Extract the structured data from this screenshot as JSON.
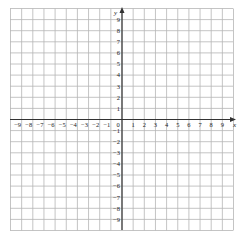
{
  "chart_data": {
    "type": "scatter",
    "title": "",
    "xlabel": "x",
    "ylabel": "y",
    "xlim": [
      -10,
      10
    ],
    "ylim": [
      -10,
      10
    ],
    "grid": true,
    "x_ticks": [
      "-9",
      "-8",
      "-7",
      "-6",
      "-5",
      "-4",
      "-3",
      "-2",
      "-1",
      "0",
      "1",
      "2",
      "3",
      "4",
      "5",
      "6",
      "7",
      "8",
      "9"
    ],
    "y_ticks": [
      "9",
      "8",
      "7",
      "6",
      "5",
      "4",
      "3",
      "2",
      "1",
      "-1",
      "-2",
      "-3",
      "-4",
      "-5",
      "-6",
      "-7",
      "-8",
      "-9"
    ],
    "x_tick_values": [
      -9,
      -8,
      -7,
      -6,
      -5,
      -4,
      -3,
      -2,
      -1,
      0,
      1,
      2,
      3,
      4,
      5,
      6,
      7,
      8,
      9
    ],
    "y_tick_values": [
      9,
      8,
      7,
      6,
      5,
      4,
      3,
      2,
      1,
      -1,
      -2,
      -3,
      -4,
      -5,
      -6,
      -7,
      -8,
      -9
    ],
    "series": [],
    "colors": {
      "grid": "#b5b5b5",
      "axis": "#333333",
      "text": "#222222"
    }
  },
  "axes": {
    "x_name": "x",
    "y_name": "y",
    "origin_label": "0"
  }
}
